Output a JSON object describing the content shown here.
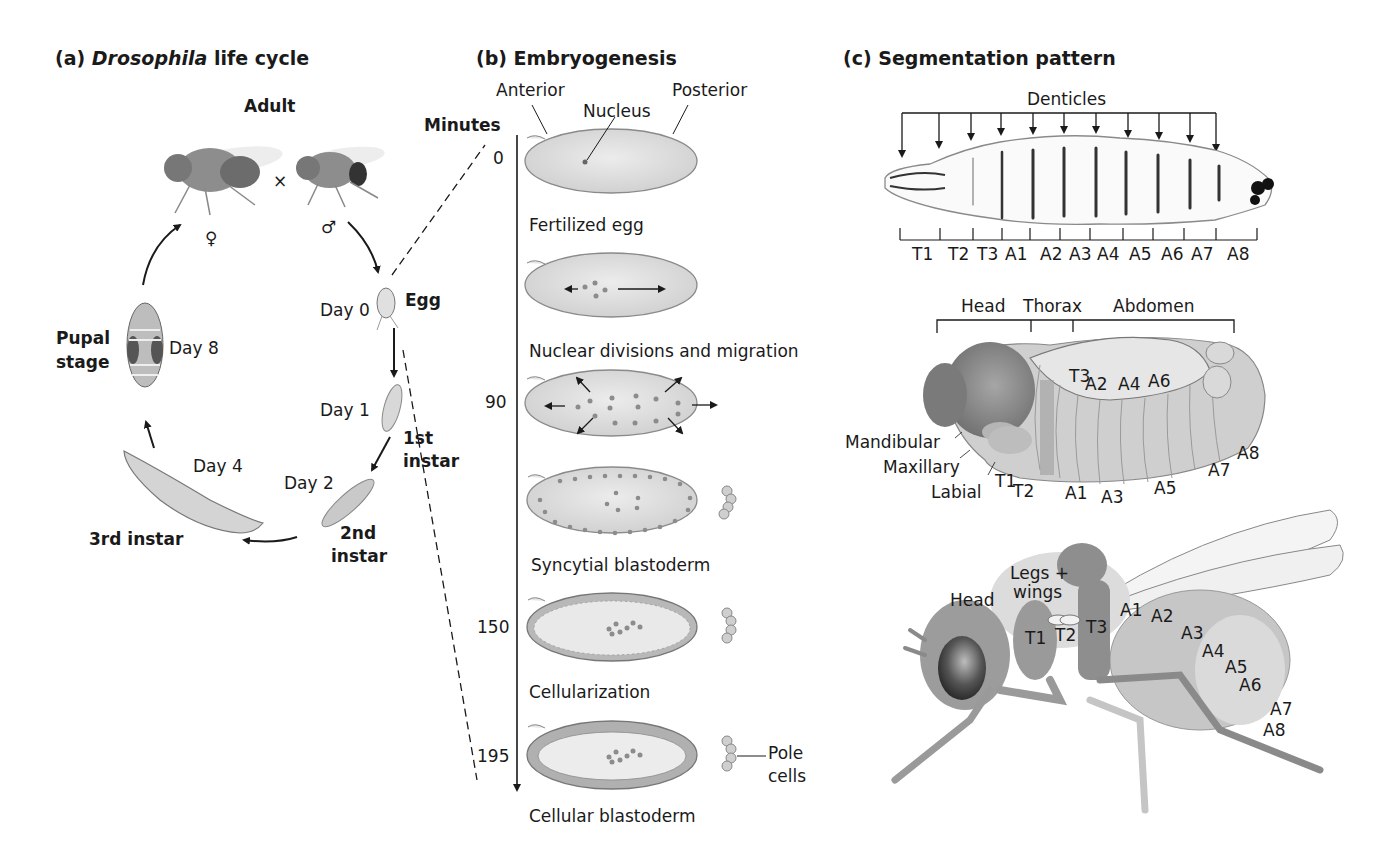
{
  "panel_a": {
    "title_prefix": "(a)",
    "title_italic": "Drosophila",
    "title_suffix": "life cycle",
    "stages": [
      {
        "name": "Adult",
        "day": ""
      },
      {
        "name": "Egg",
        "day": "Day 0"
      },
      {
        "name": "1st instar",
        "day": "Day 1"
      },
      {
        "name": "2nd instar",
        "day": "Day 2"
      },
      {
        "name": "3rd instar",
        "day": "Day 4"
      },
      {
        "name": "Pupal stage",
        "day": "Day 8"
      }
    ],
    "labels": {
      "adult": "Adult",
      "cross": "×",
      "female": "♀",
      "male": "♂",
      "egg": "Egg",
      "day0": "Day 0",
      "day1": "Day 1",
      "first_instar_1": "1st",
      "first_instar_2": "instar",
      "day2": "Day 2",
      "second_instar_1": "2nd",
      "second_instar_2": "instar",
      "day4": "Day 4",
      "third_instar": "3rd instar",
      "pupal_1": "Pupal",
      "pupal_2": "stage",
      "day8": "Day 8"
    }
  },
  "panel_b": {
    "title": "(b)  Embryogenesis",
    "axis_label": "Minutes",
    "ticks": [
      "0",
      "90",
      "150",
      "195"
    ],
    "annotations": {
      "anterior": "Anterior",
      "posterior": "Posterior",
      "nucleus": "Nucleus",
      "pole_cells_1": "Pole",
      "pole_cells_2": "cells"
    },
    "stages": [
      {
        "label": "Fertilized egg"
      },
      {
        "label": "Nuclear divisions and migration"
      },
      {
        "label": ""
      },
      {
        "label": "Syncytial blastoderm"
      },
      {
        "label": "Cellularization"
      },
      {
        "label": "Cellular blastoderm"
      }
    ]
  },
  "panel_c": {
    "title": "(c) Segmentation pattern",
    "larva": {
      "denticles_label": "Denticles",
      "segments": [
        "T1",
        "T2",
        "T3",
        "A1",
        "A2",
        "A3",
        "A4",
        "A5",
        "A6",
        "A7",
        "A8"
      ]
    },
    "embryo": {
      "regions": [
        "Head",
        "Thorax",
        "Abdomen"
      ],
      "head_segments": [
        "Mandibular",
        "Maxillary",
        "Labial"
      ],
      "upper_labels": [
        "T3",
        "A2",
        "A4",
        "A6"
      ],
      "lower_labels": [
        "T1",
        "T2",
        "A1",
        "A3",
        "A5",
        "A7",
        "A8"
      ]
    },
    "adult": {
      "head": "Head",
      "legs_wings_1": "Legs +",
      "legs_wings_2": "wings",
      "thorax_labels": [
        "T1",
        "T2",
        "T3"
      ],
      "abdomen_labels": [
        "A1",
        "A2",
        "A3",
        "A4",
        "A5",
        "A6",
        "A7",
        "A8"
      ]
    }
  },
  "colors": {
    "ink": "#1a1a1a",
    "egg_fill": "#dcdcdc",
    "egg_stroke": "#8a8a8a",
    "nucleus": "#8c8c8c",
    "dark_gray": "#7a7a7a",
    "mid_gray": "#a8a8a8",
    "light_gray": "#d6d6d6"
  }
}
